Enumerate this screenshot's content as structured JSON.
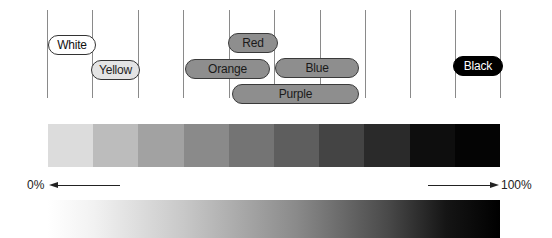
{
  "diagram": {
    "grid": {
      "vertical_line_positions": [
        47,
        92,
        138,
        183,
        229,
        274,
        320,
        365,
        410,
        455,
        500
      ]
    },
    "pills": [
      {
        "label": "White",
        "style": "white",
        "left": 48,
        "top": 35,
        "width": 48
      },
      {
        "label": "Yellow",
        "style": "yellow",
        "left": 91,
        "top": 60,
        "width": 49
      },
      {
        "label": "Red",
        "style": "gray",
        "left": 228,
        "top": 33,
        "width": 50
      },
      {
        "label": "Orange",
        "style": "gray",
        "left": 185,
        "top": 59,
        "width": 85
      },
      {
        "label": "Blue",
        "style": "gray",
        "left": 275,
        "top": 58,
        "width": 84
      },
      {
        "label": "Purple",
        "style": "gray",
        "left": 232,
        "top": 84,
        "width": 127
      },
      {
        "label": "Black",
        "style": "black",
        "left": 453,
        "top": 56,
        "width": 50
      }
    ],
    "step_bar": {
      "colors": [
        "#dcdcdc",
        "#bcbcbc",
        "#a2a2a2",
        "#8a8a8a",
        "#747474",
        "#5e5e5e",
        "#444444",
        "#2a2a2a",
        "#0e0e0e",
        "#040404"
      ]
    },
    "scale": {
      "min_label": "0%",
      "max_label": "100%"
    }
  }
}
